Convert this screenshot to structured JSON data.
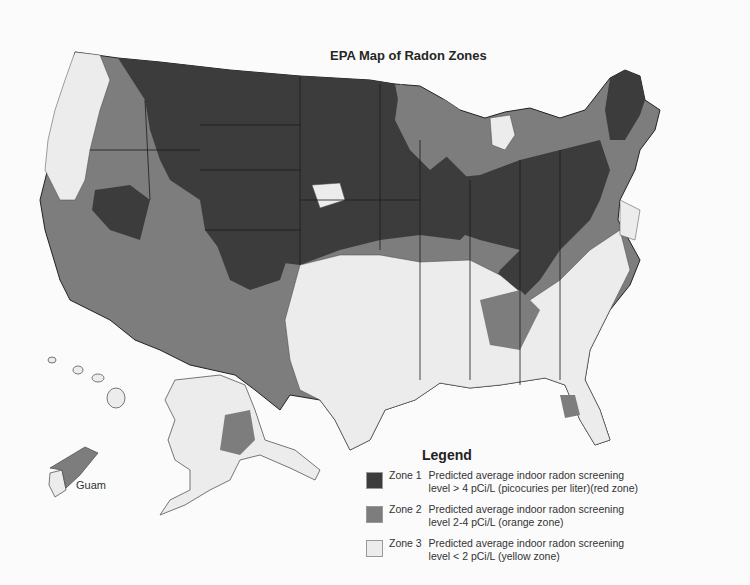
{
  "page": {
    "map_title": "EPA Map of Radon Zones",
    "inset_labels": {
      "guam": "Guam"
    }
  },
  "legend": {
    "title": "Legend",
    "zones": [
      {
        "name": "Zone 1",
        "line1": "Predicted average indoor radon screening",
        "line2": "level > 4 pCi/L (picocuries per liter)(red zone)",
        "color": "#3c3c3c"
      },
      {
        "name": "Zone 2",
        "line1": "Predicted average indoor radon screening",
        "line2": "level 2-4 pCi/L (orange zone)",
        "color": "#7d7d7d"
      },
      {
        "name": "Zone 3",
        "line1": "Predicted average indoor radon screening",
        "line2": "level < 2 pCi/L (yellow zone)",
        "color": "#ececec"
      }
    ]
  },
  "colors": {
    "zone1": "#3c3c3c",
    "zone2": "#7d7d7d",
    "zone3": "#ececec",
    "border": "#222222",
    "background": "#fbfbfb"
  }
}
